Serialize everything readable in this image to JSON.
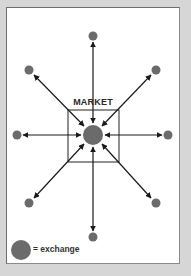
{
  "diagram": {
    "center_label": "MARKET",
    "legend": {
      "symbol": "large-dot",
      "text": "= exchange"
    },
    "colors": {
      "background": "#d6d6d6",
      "frame": "#ffffff",
      "dot": "#6b6b6b",
      "arrow": "#1a1a1a",
      "box": "#222222"
    },
    "nodes": [
      {
        "id": "top",
        "position": "top"
      },
      {
        "id": "top-left",
        "position": "top-left"
      },
      {
        "id": "top-right",
        "position": "top-right"
      },
      {
        "id": "left",
        "position": "left"
      },
      {
        "id": "right",
        "position": "right"
      },
      {
        "id": "bottom-left",
        "position": "bottom-left"
      },
      {
        "id": "bottom-right",
        "position": "bottom-right"
      },
      {
        "id": "bottom",
        "position": "bottom"
      }
    ],
    "arrows": "bidirectional, each outer node connected to central market exchange"
  }
}
